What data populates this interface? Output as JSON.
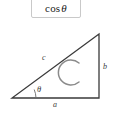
{
  "formula": {
    "function_name": "cos",
    "variable": "θ",
    "full_text": "cos θ"
  },
  "diagram": {
    "type": "right-triangle",
    "glyph_inside": "C",
    "labels": {
      "adjacent": "a",
      "opposite": "b",
      "hypotenuse": "c",
      "angle": "θ"
    },
    "vertices": {
      "left": [
        12,
        98
      ],
      "bottom_right": [
        99,
        98
      ],
      "top_right": [
        99,
        34
      ]
    },
    "colors": {
      "stroke": "#3a3a3a",
      "glyph": "#808080",
      "background": "#ffffff",
      "box_border": "#c9c9c9"
    }
  }
}
